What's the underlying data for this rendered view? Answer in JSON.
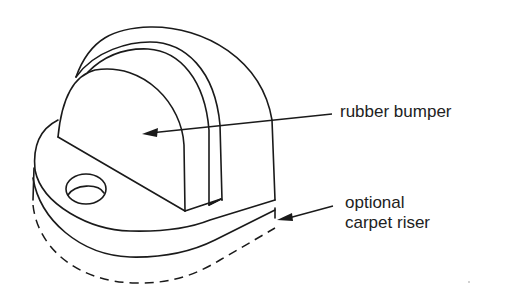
{
  "figure": {
    "labels": {
      "bumper": "rubber bumper",
      "riser_line1": "optional",
      "riser_line2": "carpet riser"
    }
  },
  "colors": {
    "ink": "#1a1a1a",
    "background": "#ffffff"
  }
}
